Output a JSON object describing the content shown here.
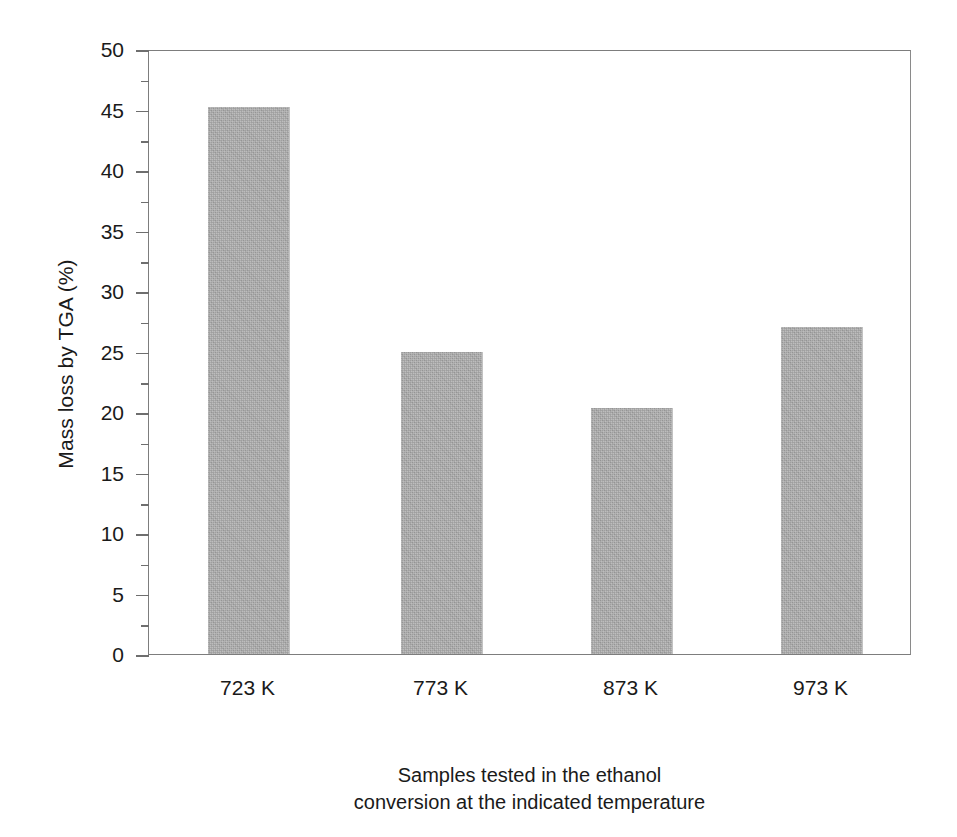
{
  "chart_data": {
    "type": "bar",
    "title": "",
    "subtitle": "",
    "categories": [
      "723 K",
      "773 K",
      "873 K",
      "973 K"
    ],
    "values": [
      45.2,
      25.0,
      20.3,
      27.0
    ],
    "series": [
      {
        "name": "Mass loss by TGA (%)",
        "values": [
          45.2,
          25.0,
          20.3,
          27.0
        ]
      }
    ],
    "xlabel_line1": "Samples tested in the ethanol",
    "xlabel_line2": "conversion at the indicated temperature",
    "ylabel": "Mass loss by TGA (%)",
    "ylim": [
      0,
      50
    ],
    "ytick_step": 5,
    "yminor_step": 2.5,
    "yticks": [
      "0",
      "5",
      "10",
      "15",
      "20",
      "25",
      "30",
      "35",
      "40",
      "45",
      "50"
    ],
    "ytick_values": [
      0,
      5,
      10,
      15,
      20,
      25,
      30,
      35,
      40,
      45,
      50
    ],
    "yminor_values": [
      2.5,
      7.5,
      12.5,
      17.5,
      22.5,
      27.5,
      32.5,
      37.5,
      42.5,
      47.5
    ],
    "grid": false,
    "legend": "none",
    "bar_color": "#a9a9a9",
    "bar_edge_color": "#c3c3c3",
    "axis_color": "#7d7d7d",
    "text_color": "#1a1a1a",
    "background": "#ffffff"
  }
}
